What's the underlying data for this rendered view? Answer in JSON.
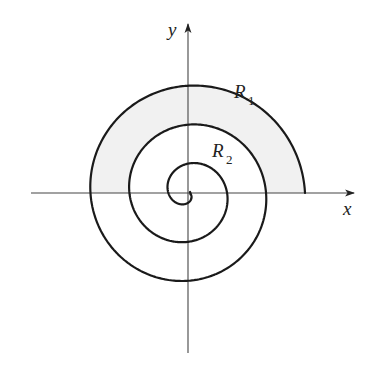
{
  "diagram": {
    "type": "archimedean-spiral",
    "colors": {
      "background": "#ffffff",
      "spiral": "#1a1a1a",
      "axes": "#444444",
      "shading_R1": "#f1f1f1"
    },
    "axes": {
      "x_label": "x",
      "y_label": "y"
    },
    "spiral": {
      "turns": 3,
      "start_radius_px": 117,
      "radius_decrease_per_radian_px": 6.2,
      "measured_quarter_turn_radii_px": [
        117,
        111,
        99,
        91,
        78,
        70,
        59,
        50,
        39,
        30,
        21,
        12
      ]
    },
    "regions": [
      {
        "id": "R1",
        "letter": "R",
        "subscript": "1",
        "shaded": true
      },
      {
        "id": "R2",
        "letter": "R",
        "subscript": "2",
        "shaded": false
      }
    ]
  }
}
